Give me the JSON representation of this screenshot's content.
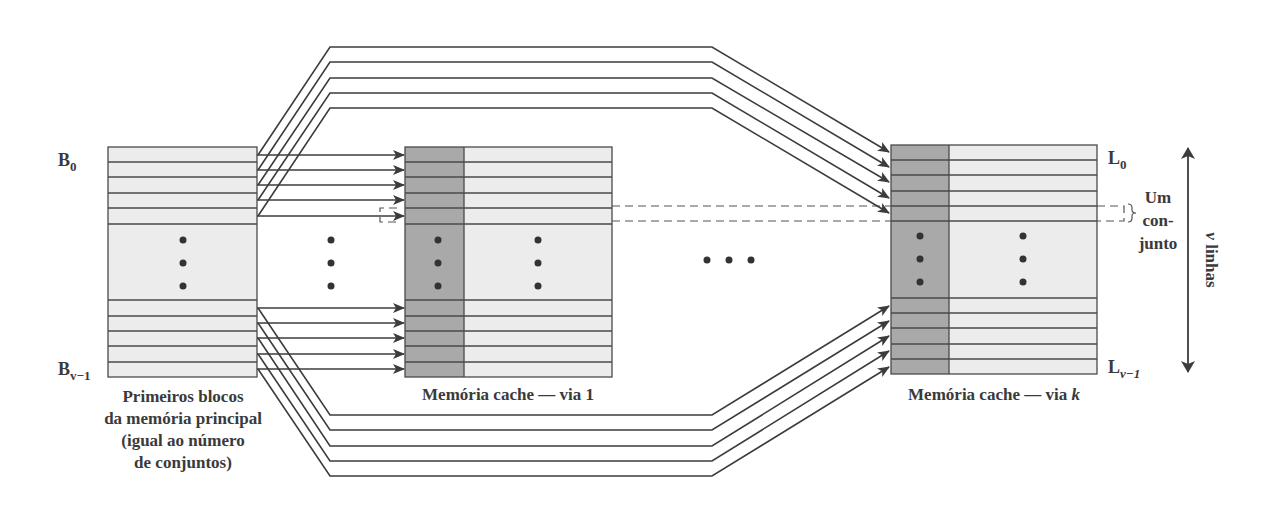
{
  "diagram": {
    "main_memory": {
      "label_top": "B",
      "label_top_sub": "0",
      "label_bottom": "B",
      "label_bottom_sub": "v−1",
      "caption_lines": [
        "Primeiros blocos",
        "da memória principal",
        "(igual ao número",
        "de conjuntos)"
      ],
      "fill": "#ececec"
    },
    "cache_way_1": {
      "caption": "Memória cache — via 1",
      "tag_fill": "#a9a9a9",
      "line_fill": "#ececec"
    },
    "cache_way_k": {
      "caption_prefix": "Memória cache — via ",
      "caption_var": "k",
      "label_top": "L",
      "label_top_sub": "0",
      "label_bottom": "L",
      "label_bottom_sub": "v−1"
    },
    "set_annotation": {
      "lines": [
        "Um",
        "con-",
        "junto"
      ]
    },
    "lines_annotation": {
      "var": "v",
      "text": " linhas"
    },
    "ellipsis_between_ways": "• • •",
    "colors": {
      "stroke": "#3c3c3c",
      "text": "#3a3a3a",
      "tag_column": "#a9a9a9",
      "block_fill": "#ececec"
    }
  }
}
